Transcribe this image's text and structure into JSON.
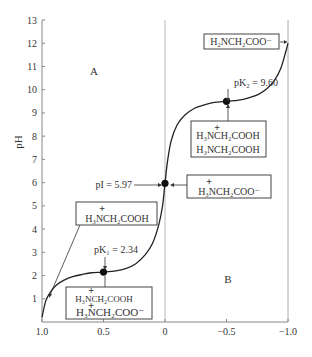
{
  "chart_data": {
    "type": "line",
    "title": "",
    "xlabel": "",
    "ylabel": "pH",
    "xlim": [
      1.0,
      -1.0
    ],
    "ylim": [
      0,
      13
    ],
    "x_ticks": [
      "1.0",
      "0.5",
      "0",
      "-0.5",
      "-1.0"
    ],
    "x_tick_values": [
      1.0,
      0.5,
      0,
      -0.5,
      -1.0
    ],
    "y_ticks": [
      "1",
      "2",
      "3",
      "4",
      "5",
      "6",
      "7",
      "8",
      "9",
      "10",
      "11",
      "12",
      "13"
    ],
    "y_tick_values": [
      1,
      2,
      3,
      4,
      5,
      6,
      7,
      8,
      9,
      10,
      11,
      12,
      13
    ],
    "grid": false,
    "reference_line_x": 0,
    "series": [
      {
        "name": "glycine titration curve",
        "x": [
          1.0,
          0.97,
          0.93,
          0.88,
          0.82,
          0.75,
          0.67,
          0.6,
          0.5,
          0.4,
          0.32,
          0.24,
          0.16,
          0.1,
          0.05,
          0.02,
          0.0,
          -0.02,
          -0.05,
          -0.1,
          -0.16,
          -0.24,
          -0.32,
          -0.4,
          -0.5,
          -0.6,
          -0.68,
          -0.76,
          -0.83,
          -0.89,
          -0.94,
          -0.98,
          -1.0
        ],
        "y": [
          0.2,
          0.9,
          1.3,
          1.6,
          1.8,
          1.95,
          2.05,
          2.12,
          2.15,
          2.2,
          2.3,
          2.5,
          2.9,
          3.4,
          4.2,
          5.0,
          5.97,
          6.9,
          7.8,
          8.5,
          8.9,
          9.2,
          9.35,
          9.45,
          9.5,
          9.55,
          9.65,
          9.8,
          10.05,
          10.4,
          10.9,
          11.6,
          12.0
        ]
      }
    ],
    "key_points": [
      {
        "name": "pK1",
        "x": 0.5,
        "y": 2.15,
        "label": "pK₁ = 2.34"
      },
      {
        "name": "pI",
        "x": 0.0,
        "y": 5.97,
        "label": "pI = 5.97"
      },
      {
        "name": "pK2",
        "x": -0.5,
        "y": 9.5,
        "label": "pK₂ = 9.60"
      }
    ],
    "region_labels": [
      "A",
      "B"
    ],
    "annotations": [
      {
        "id": "fully-protonated",
        "lines": [
          "⁺H₃NCH₂COOH"
        ]
      },
      {
        "id": "pk1-mixture",
        "lines": [
          "⁺H₃NCH₂COOH",
          "⁺H₃NCH₂COO⁻"
        ]
      },
      {
        "id": "zwitterion",
        "lines": [
          "⁺H₃NCH₂COO⁻"
        ]
      },
      {
        "id": "pk2-mixture",
        "lines": [
          "⁺H₃NCH₂COOH",
          "H₃NCH₂COOH"
        ]
      },
      {
        "id": "anion",
        "lines": [
          "H₂NCH₂COO⁻"
        ]
      }
    ]
  },
  "labels": {
    "region_a": "A",
    "region_b": "B",
    "ylabel": "pH",
    "pk1": "pK₁ = 2.34",
    "pi": "pI = 5.97",
    "pk2": "pK₂ = 9.60",
    "box_fully_protonated": "H₃NCH₂COOH",
    "box_pk1_line1": "H₃NCH₂COOH",
    "box_pk1_line2": "H₃NCH₂COO⁻",
    "box_zwitterion": "H₃NCH₂COO⁻",
    "box_pk2_line1": "H₃NCH₂COOH",
    "box_pk2_line2": "H₃NCH₂COOH",
    "box_anion": "H₂NCH₂COO⁻",
    "plus": "+"
  }
}
